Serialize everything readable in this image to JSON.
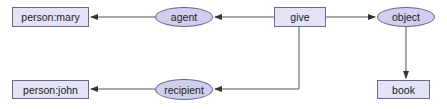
{
  "diagram": {
    "type": "semantic-network",
    "nodes": [
      {
        "id": "person_mary",
        "label": "person:mary",
        "shape": "rect",
        "x": 12,
        "y": 7,
        "w": 77,
        "h": 20
      },
      {
        "id": "agent",
        "label": "agent",
        "shape": "ellipse",
        "x": 155,
        "y": 7,
        "w": 58,
        "h": 20
      },
      {
        "id": "give",
        "label": "give",
        "shape": "rect",
        "x": 274,
        "y": 7,
        "w": 52,
        "h": 20
      },
      {
        "id": "object",
        "label": "object",
        "shape": "ellipse",
        "x": 377,
        "y": 7,
        "w": 58,
        "h": 20
      },
      {
        "id": "person_john",
        "label": "person:john",
        "shape": "rect",
        "x": 12,
        "y": 80,
        "w": 77,
        "h": 19
      },
      {
        "id": "recipient",
        "label": "recipient",
        "shape": "ellipse",
        "x": 155,
        "y": 79,
        "w": 58,
        "h": 21
      },
      {
        "id": "book",
        "label": "book",
        "shape": "rect",
        "x": 377,
        "y": 80,
        "w": 53,
        "h": 19
      }
    ],
    "edges": [
      {
        "from": "give",
        "to": "agent"
      },
      {
        "from": "agent",
        "to": "person_mary"
      },
      {
        "from": "give",
        "to": "object"
      },
      {
        "from": "object",
        "to": "book"
      },
      {
        "from": "give",
        "to": "recipient"
      },
      {
        "from": "recipient",
        "to": "person_john"
      }
    ],
    "colors": {
      "rect_fill": "#e2e3f5",
      "ellipse_fill": "#cfd0ee",
      "border": "#6a6a86",
      "edge": "#555555"
    }
  }
}
